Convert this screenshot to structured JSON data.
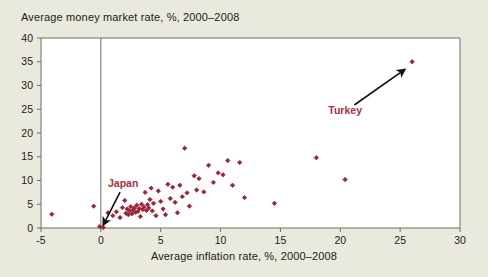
{
  "chart_data": {
    "type": "scatter",
    "title": "Average money market rate, %, 2000–2008",
    "xlabel": "Average inflation rate, %, 2000–2008",
    "ylabel": "Average money market rate, %, 2000–2008",
    "xlim": [
      -5,
      30
    ],
    "ylim": [
      0,
      40
    ],
    "xticks": [
      "-5",
      "0",
      "5",
      "10",
      "15",
      "20",
      "25",
      "30"
    ],
    "xtick_values": [
      -5,
      0,
      5,
      10,
      15,
      20,
      25,
      30
    ],
    "yticks": [
      "0",
      "5",
      "10",
      "15",
      "20",
      "25",
      "30",
      "35",
      "40"
    ],
    "ytick_values": [
      0,
      5,
      10,
      15,
      20,
      25,
      30,
      35,
      40
    ],
    "grid": false,
    "legend": "none",
    "marker_color": "#9b2335",
    "marker_shape": "diamond",
    "reference_line_x": 0,
    "points": [
      [
        -4.1,
        2.9
      ],
      [
        -0.6,
        4.6
      ],
      [
        -0.1,
        0.3
      ],
      [
        0.2,
        0.1
      ],
      [
        0.6,
        3.2
      ],
      [
        1.0,
        2.6
      ],
      [
        1.3,
        3.4
      ],
      [
        1.6,
        2.2
      ],
      [
        1.8,
        4.3
      ],
      [
        2.0,
        5.8
      ],
      [
        2.1,
        3.1
      ],
      [
        2.2,
        4.0
      ],
      [
        2.3,
        2.8
      ],
      [
        2.4,
        3.6
      ],
      [
        2.5,
        4.5
      ],
      [
        2.6,
        3.0
      ],
      [
        2.7,
        3.8
      ],
      [
        2.8,
        4.2
      ],
      [
        2.9,
        3.3
      ],
      [
        3.0,
        4.8
      ],
      [
        3.1,
        3.5
      ],
      [
        3.2,
        4.1
      ],
      [
        3.3,
        2.4
      ],
      [
        3.4,
        5.0
      ],
      [
        3.5,
        3.9
      ],
      [
        3.6,
        4.4
      ],
      [
        3.7,
        7.5
      ],
      [
        3.8,
        3.7
      ],
      [
        3.9,
        4.9
      ],
      [
        4.0,
        4.2
      ],
      [
        4.1,
        6.0
      ],
      [
        4.2,
        8.4
      ],
      [
        4.3,
        3.6
      ],
      [
        4.4,
        5.2
      ],
      [
        4.6,
        2.6
      ],
      [
        4.8,
        7.8
      ],
      [
        5.0,
        5.6
      ],
      [
        5.2,
        4.0
      ],
      [
        5.4,
        2.8
      ],
      [
        5.6,
        9.2
      ],
      [
        5.8,
        6.2
      ],
      [
        6.0,
        8.6
      ],
      [
        6.2,
        5.4
      ],
      [
        6.4,
        3.2
      ],
      [
        6.6,
        9.0
      ],
      [
        6.8,
        6.6
      ],
      [
        7.0,
        16.8
      ],
      [
        7.2,
        7.4
      ],
      [
        7.4,
        4.6
      ],
      [
        7.8,
        11.0
      ],
      [
        8.0,
        8.0
      ],
      [
        8.2,
        10.4
      ],
      [
        8.6,
        7.6
      ],
      [
        9.0,
        13.2
      ],
      [
        9.4,
        9.6
      ],
      [
        9.8,
        11.6
      ],
      [
        10.2,
        11.2
      ],
      [
        10.6,
        14.2
      ],
      [
        11.0,
        9.0
      ],
      [
        11.6,
        13.8
      ],
      [
        12.0,
        6.4
      ],
      [
        14.5,
        5.2
      ],
      [
        18.0,
        14.8
      ],
      [
        20.4,
        10.2
      ],
      [
        26.0,
        35.0
      ]
    ],
    "annotations": [
      {
        "label": "Japan",
        "text_x": 0.6,
        "text_y": 8.6,
        "target_x": 0.2,
        "target_y": 0.6,
        "color": "#a33244"
      },
      {
        "label": "Turkey",
        "text_x": 19.0,
        "text_y": 24.0,
        "target_x": 25.4,
        "target_y": 33.4,
        "color": "#a33244"
      }
    ]
  },
  "colors": {
    "background": "#e9e9dd",
    "plot_background": "#ffffff",
    "axis": "#6e6e64",
    "marker": "#9b2335",
    "annotation": "#a33244",
    "arrow": "#111111",
    "text": "#1b1b1b"
  }
}
